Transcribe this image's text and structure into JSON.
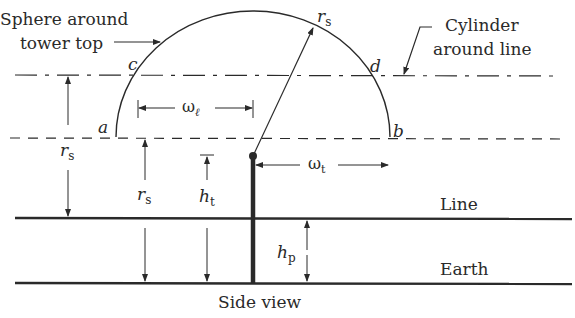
{
  "diagram": {
    "caption": "Side view",
    "labels": {
      "sphere_line1": "Sphere around",
      "sphere_line2": "tower top",
      "cylinder_line1": "Cylinder",
      "cylinder_line2": "around line",
      "line": "Line",
      "earth": "Earth"
    },
    "points": {
      "a": "a",
      "b": "b",
      "c": "c",
      "d": "d"
    },
    "symbols": {
      "rs_radius": "r",
      "rs_sub": "s",
      "omega": "ω",
      "omega_l_sub": "ℓ",
      "omega_t_sub": "t",
      "h": "h",
      "ht_sub": "t",
      "hp_sub": "p"
    },
    "colors": {
      "ink": "#2a2a2a",
      "background": "#ffffff"
    }
  }
}
